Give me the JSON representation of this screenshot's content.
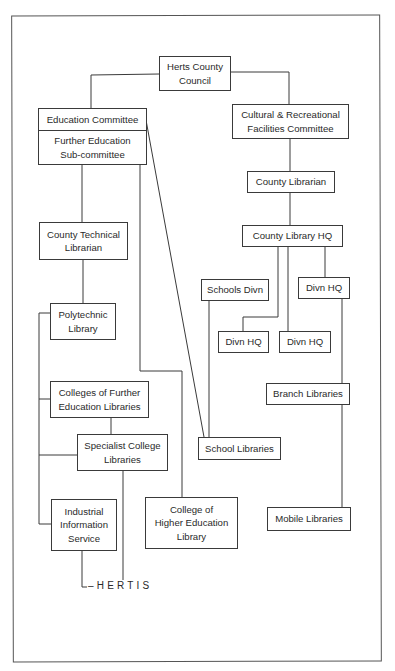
{
  "diagram": {
    "type": "organization-chart",
    "nodes": {
      "council": "Herts County Council",
      "education_committee": "Education Committee",
      "fe_subcommittee": "Further Education\nSub-committee",
      "cultural_committee": "Cultural & Recreational\nFacilities Committee",
      "county_librarian": "County Librarian",
      "county_library_hq": "County Library HQ",
      "schools_divn": "Schools Divn",
      "divn_hq_right": "Divn HQ",
      "divn_hq_left": "Divn HQ",
      "divn_hq_mid": "Divn HQ",
      "branch_libraries": "Branch Libraries",
      "school_libraries": "School Libraries",
      "mobile_libraries": "Mobile Libraries",
      "county_technical_librarian": "County Technical\nLibrarian",
      "polytechnic_library": "Polytechnic\nLibrary",
      "colleges_fe_libraries": "Colleges of Further\nEducation Libraries",
      "specialist_college_libraries": "Specialist College\nLibraries",
      "industrial_information_service": "Industrial\nInformation\nService",
      "college_higher_education_library": "College of\nHigher Education\nLibrary"
    },
    "hertis_label": "–HERTIS",
    "edges": [
      [
        "council",
        "education_committee"
      ],
      [
        "council",
        "cultural_committee"
      ],
      [
        "cultural_committee",
        "county_librarian"
      ],
      [
        "county_librarian",
        "county_library_hq"
      ],
      [
        "county_library_hq",
        "divn_hq_left"
      ],
      [
        "county_library_hq",
        "divn_hq_mid"
      ],
      [
        "county_library_hq",
        "divn_hq_right"
      ],
      [
        "divn_hq_right",
        "branch_libraries"
      ],
      [
        "branch_libraries",
        "mobile_libraries"
      ],
      [
        "schools_divn",
        "school_libraries"
      ],
      [
        "education_committee",
        "school_libraries"
      ],
      [
        "fe_subcommittee",
        "county_technical_librarian"
      ],
      [
        "fe_subcommittee",
        "college_higher_education_library"
      ],
      [
        "county_technical_librarian",
        "polytechnic_library"
      ],
      [
        "polytechnic_library",
        "colleges_fe_libraries"
      ],
      [
        "polytechnic_library",
        "specialist_college_libraries"
      ],
      [
        "polytechnic_library",
        "industrial_information_service"
      ],
      [
        "colleges_fe_libraries",
        "specialist_college_libraries"
      ],
      [
        "industrial_information_service",
        "hertis"
      ],
      [
        "specialist_college_libraries",
        "hertis"
      ]
    ]
  }
}
